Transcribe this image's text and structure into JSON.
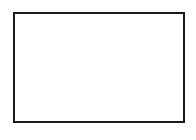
{
  "figure": {
    "name": "piano-keyboard-diagram",
    "caption": "",
    "style": "line-art",
    "colors": {
      "stroke": "#1a1a1a",
      "white_key_fill": "#ffffff",
      "black_key_fill": "#ffffff",
      "background": "#ffffff"
    },
    "canvas": {
      "width": 196,
      "height": 140
    },
    "frame": {
      "x": 13.5,
      "y": 12.5,
      "width": 170,
      "height": 109,
      "stroke_width": 2
    }
  },
  "chart_data": {
    "type": "diagram",
    "white_key_count": 8,
    "black_key_count": 5,
    "black_key_groups": [
      3,
      2
    ],
    "white_keys": [
      {
        "index": 0,
        "x": 13.5,
        "width": 21.25
      },
      {
        "index": 1,
        "x": 34.75,
        "width": 21.25
      },
      {
        "index": 2,
        "x": 56.0,
        "width": 21.25
      },
      {
        "index": 3,
        "x": 77.25,
        "width": 21.25
      },
      {
        "index": 4,
        "x": 98.5,
        "width": 21.25
      },
      {
        "index": 5,
        "x": 119.75,
        "width": 21.25
      },
      {
        "index": 6,
        "x": 141.0,
        "width": 21.25
      },
      {
        "index": 7,
        "x": 162.25,
        "width": 21.25
      }
    ],
    "white_key_dividers": [
      34.75,
      56.0,
      77.25,
      98.5,
      119.75,
      141.0,
      162.25
    ],
    "black_keys": [
      {
        "index": 0,
        "group": 0,
        "x": 26.5,
        "width": 16,
        "y": 12.5,
        "height": 65
      },
      {
        "index": 1,
        "group": 0,
        "x": 49.0,
        "width": 16,
        "y": 12.5,
        "height": 65
      },
      {
        "index": 2,
        "group": 0,
        "x": 71.0,
        "width": 16,
        "y": 12.5,
        "height": 65
      },
      {
        "index": 3,
        "group": 1,
        "x": 112.0,
        "width": 16,
        "y": 12.5,
        "height": 65
      },
      {
        "index": 4,
        "group": 1,
        "x": 134.0,
        "width": 16,
        "y": 12.5,
        "height": 65
      }
    ],
    "black_key_bottom_y": 77.5,
    "white_key_bottom_y": 121.5,
    "xlabel": "",
    "ylabel": "",
    "legend": [],
    "annotations": []
  }
}
